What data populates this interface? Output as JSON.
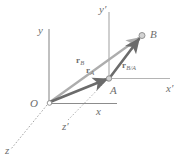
{
  "figure": {
    "background_color": "#ffffff",
    "axes": [
      {
        "name": "y",
        "label": "y",
        "primed": false,
        "color": "#8c8c8c"
      },
      {
        "name": "x",
        "label": "x",
        "primed": false,
        "color": "#8c8c8c"
      },
      {
        "name": "z",
        "label": "z",
        "primed": false,
        "color": "#9a9a9a",
        "style": "dashed"
      },
      {
        "name": "y-prime",
        "label": "y′",
        "primed": true,
        "color": "#a8a8a8"
      },
      {
        "name": "x-prime",
        "label": "x′",
        "primed": true,
        "color": "#b4b4b4"
      },
      {
        "name": "z-prime",
        "label": "z′",
        "primed": true,
        "color": "#a8a8a8",
        "style": "dashed"
      }
    ],
    "points": [
      {
        "name": "O",
        "label": "O",
        "marker": "open-circle"
      },
      {
        "name": "A",
        "label": "A",
        "marker": "open-circle"
      },
      {
        "name": "B",
        "label": "B",
        "marker": "open-circle"
      }
    ],
    "vectors": [
      {
        "name": "r-B",
        "base": "r",
        "subscript": "B",
        "from": "O",
        "to": "B",
        "color": "#adadad"
      },
      {
        "name": "r-A",
        "base": "r",
        "subscript": "A",
        "from": "O",
        "to": "A",
        "color": "#6b6b6b"
      },
      {
        "name": "r-B-A",
        "base": "r",
        "subscript": "B/A",
        "from": "A",
        "to": "B",
        "color": "#6b6b6b"
      }
    ],
    "colors": {
      "label_gray": "#6e6e6e",
      "vector_light": "#adadad",
      "vector_dark": "#6b6b6b",
      "axis_gray": "#8c8c8c"
    }
  }
}
